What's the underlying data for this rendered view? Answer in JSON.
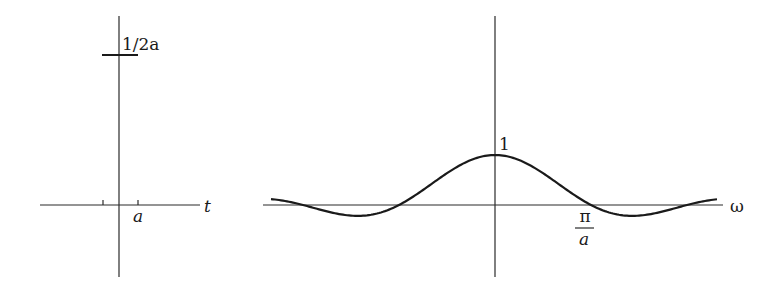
{
  "left_panel": {
    "title": "Rectangular pulse in time domain",
    "height_label": "1/2a",
    "tick_label": "a",
    "axis_label": "t"
  },
  "right_panel": {
    "title": "Fourier transform (sinc) in frequency domain",
    "peak_label": "1",
    "zero_label_numerator": "π",
    "zero_label_denominator": "a",
    "axis_label": "ω"
  },
  "colors": {
    "ink": "#1a1a1a",
    "axis": "#2b2b2b",
    "background": "#ffffff"
  }
}
